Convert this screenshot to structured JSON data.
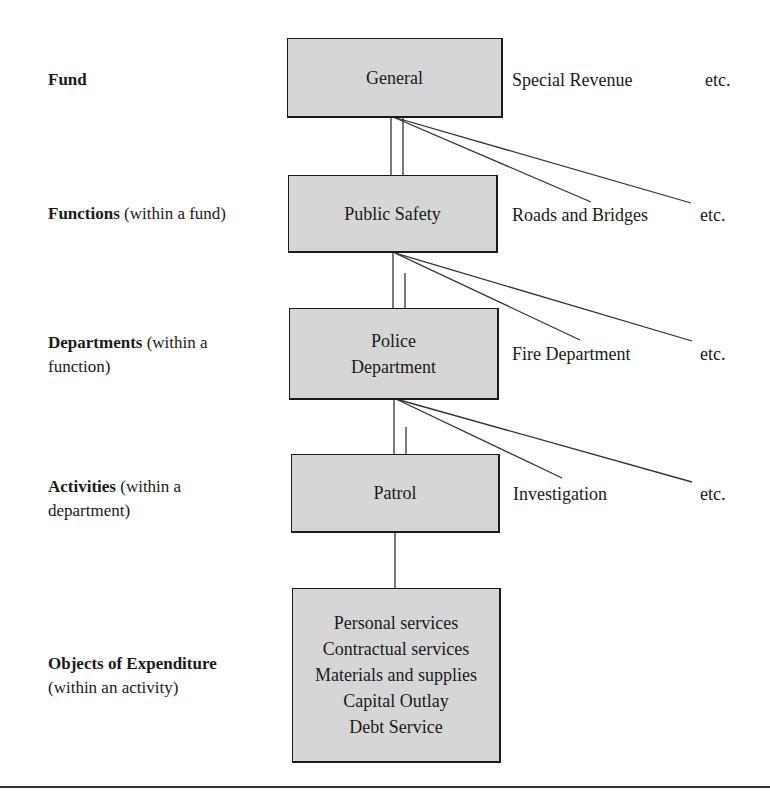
{
  "levels": [
    {
      "bold": "Fund",
      "rest": "",
      "rest2": ""
    },
    {
      "bold": "Functions",
      "rest": " (within a fund)",
      "rest2": ""
    },
    {
      "bold": "Departments",
      "rest": " (within a",
      "rest2": "function)"
    },
    {
      "bold": "Activities",
      "rest": " (within a",
      "rest2": "department)"
    },
    {
      "bold": "Objects of Expenditure",
      "rest": "",
      "rest2": "(within an activity)"
    }
  ],
  "boxes": {
    "fund": "General",
    "function": "Public Safety",
    "department_line1": "Police",
    "department_line2": "Department",
    "activity": "Patrol",
    "objects": [
      "Personal services",
      "Contractual services",
      "Materials and supplies",
      "Capital Outlay",
      "Debt Service"
    ]
  },
  "siblings": {
    "fund": {
      "name": "Special Revenue",
      "etc": "etc."
    },
    "function": {
      "name": "Roads and Bridges",
      "etc": "etc."
    },
    "department": {
      "name": "Fire Department",
      "etc": "etc."
    },
    "activity": {
      "name": "Investigation",
      "etc": "etc."
    }
  },
  "colors": {
    "box_fill": "#d6d6d6",
    "line": "#1a1a1a"
  }
}
